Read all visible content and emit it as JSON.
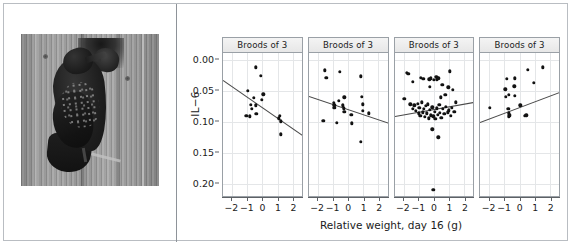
{
  "figure": {
    "photo": {
      "caption_alt": "Adult European starling feeding a nestling at a wooden nest box",
      "subject": "starling-at-nestbox"
    }
  },
  "chart_data": {
    "type": "scatter",
    "title": "",
    "xlabel": "Relative weight, day 16 (g)",
    "ylabel": "IL−6",
    "xlim": [
      -2.6,
      2.6
    ],
    "ylim": [
      0.225,
      -0.012
    ],
    "y_inverted": true,
    "grid": true,
    "legend": "none",
    "xticks": [
      -2,
      -1,
      0,
      1,
      2
    ],
    "xticklabels": [
      "−2",
      "−1",
      "0",
      "1",
      "2"
    ],
    "yticks": [
      0.0,
      0.05,
      0.1,
      0.15,
      0.2
    ],
    "yticklabels": [
      "0.00",
      "0.05",
      "0.10",
      "0.15",
      "0.20"
    ],
    "panels": [
      {
        "strip_label": "Broods of 3",
        "n": 16,
        "fit": {
          "slope": 0.0175,
          "intercept": 0.0775
        },
        "points": [
          [
            -0.45,
            0.011
          ],
          [
            -0.1,
            0.025
          ],
          [
            0.05,
            0.055
          ],
          [
            -0.95,
            0.049
          ],
          [
            -0.55,
            0.061
          ],
          [
            -0.05,
            0.064
          ],
          [
            -0.75,
            0.072
          ],
          [
            -0.7,
            0.079
          ],
          [
            -0.45,
            0.073
          ],
          [
            -1.05,
            0.09
          ],
          [
            -0.85,
            0.091
          ],
          [
            -0.4,
            0.087
          ],
          [
            1.1,
            0.094
          ],
          [
            1.15,
            0.09
          ],
          [
            1.2,
            0.099
          ],
          [
            1.2,
            0.12
          ]
        ]
      },
      {
        "strip_label": "Broods of 3",
        "n": 21,
        "fit": {
          "slope": 0.0085,
          "intercept": 0.08
        },
        "points": [
          [
            -1.55,
            0.016
          ],
          [
            -1.45,
            0.028
          ],
          [
            -0.55,
            0.019
          ],
          [
            0.85,
            0.026
          ],
          [
            -0.25,
            0.06
          ],
          [
            0.9,
            0.059
          ],
          [
            -0.95,
            0.069
          ],
          [
            -0.9,
            0.073
          ],
          [
            -0.9,
            0.077
          ],
          [
            -0.6,
            0.066
          ],
          [
            -0.35,
            0.073
          ],
          [
            -0.3,
            0.078
          ],
          [
            -0.25,
            0.083
          ],
          [
            0.95,
            0.071
          ],
          [
            0.95,
            0.082
          ],
          [
            0.2,
            0.088
          ],
          [
            1.35,
            0.086
          ],
          [
            -1.65,
            0.098
          ],
          [
            -0.75,
            0.101
          ],
          [
            0.25,
            0.102
          ],
          [
            0.85,
            0.132
          ]
        ]
      },
      {
        "strip_label": "Broods of 3",
        "n": 58,
        "fit": {
          "slope": -0.0045,
          "intercept": 0.079
        },
        "points": [
          [
            -1.8,
            0.02
          ],
          [
            -1.7,
            0.022
          ],
          [
            -1.4,
            0.035
          ],
          [
            1.05,
            0.018
          ],
          [
            -0.85,
            0.028
          ],
          [
            -0.7,
            0.03
          ],
          [
            -0.3,
            0.031
          ],
          [
            -0.2,
            0.029
          ],
          [
            0.0,
            0.032
          ],
          [
            0.15,
            0.027
          ],
          [
            0.2,
            0.031
          ],
          [
            0.3,
            0.029
          ],
          [
            -0.25,
            0.043
          ],
          [
            0.55,
            0.04
          ],
          [
            0.95,
            0.044
          ],
          [
            1.25,
            0.048
          ],
          [
            -1.95,
            0.062
          ],
          [
            -1.55,
            0.071
          ],
          [
            -1.4,
            0.079
          ],
          [
            -1.3,
            0.073
          ],
          [
            -1.2,
            0.082
          ],
          [
            -1.05,
            0.07
          ],
          [
            -1.0,
            0.086
          ],
          [
            -0.95,
            0.077
          ],
          [
            -0.9,
            0.09
          ],
          [
            -0.8,
            0.068
          ],
          [
            -0.75,
            0.084
          ],
          [
            -0.65,
            0.079
          ],
          [
            -0.6,
            0.092
          ],
          [
            -0.55,
            0.074
          ],
          [
            -0.45,
            0.086
          ],
          [
            -0.4,
            0.071
          ],
          [
            -0.35,
            0.094
          ],
          [
            -0.25,
            0.08
          ],
          [
            -0.2,
            0.089
          ],
          [
            -0.1,
            0.076
          ],
          [
            -0.05,
            0.091
          ],
          [
            0.05,
            0.083
          ],
          [
            0.1,
            0.095
          ],
          [
            0.2,
            0.078
          ],
          [
            0.25,
            0.088
          ],
          [
            0.35,
            0.072
          ],
          [
            0.4,
            0.085
          ],
          [
            0.5,
            0.093
          ],
          [
            0.6,
            0.079
          ],
          [
            0.7,
            0.087
          ],
          [
            0.8,
            0.075
          ],
          [
            0.9,
            0.084
          ],
          [
            1.0,
            0.081
          ],
          [
            1.1,
            0.09
          ],
          [
            1.2,
            0.077
          ],
          [
            1.35,
            0.083
          ],
          [
            0.45,
            0.06
          ],
          [
            0.75,
            0.056
          ],
          [
            -0.1,
            0.112
          ],
          [
            0.3,
            0.125
          ],
          [
            -0.05,
            0.21
          ],
          [
            1.45,
            0.068
          ]
        ]
      },
      {
        "strip_label": "Broods of 3",
        "n": 18,
        "fit": {
          "slope": -0.0095,
          "intercept": 0.076
        },
        "points": [
          [
            0.55,
            0.015
          ],
          [
            1.55,
            0.011
          ],
          [
            -0.85,
            0.03
          ],
          [
            -0.3,
            0.029
          ],
          [
            0.95,
            0.036
          ],
          [
            -0.95,
            0.047
          ],
          [
            -0.35,
            0.042
          ],
          [
            -0.9,
            0.059
          ],
          [
            -0.7,
            0.056
          ],
          [
            -0.3,
            0.057
          ],
          [
            -1.95,
            0.077
          ],
          [
            -0.75,
            0.079
          ],
          [
            -0.7,
            0.086
          ],
          [
            -0.7,
            0.091
          ],
          [
            -0.65,
            0.089
          ],
          [
            0.05,
            0.073
          ],
          [
            0.35,
            0.09
          ],
          [
            0.45,
            0.089
          ]
        ]
      }
    ]
  }
}
